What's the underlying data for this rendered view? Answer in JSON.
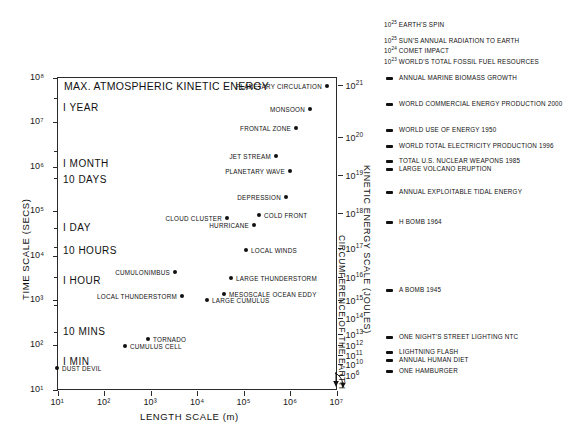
{
  "chart_data": {
    "type": "scatter",
    "title": "MAX. ATMOSPHERIC KINETIC ENERGY",
    "xlabel": "LENGTH SCALE (m)",
    "ylabel": "TIME SCALE (SECS)",
    "y2label": "KINETIC ENERGY SCALE (JOULES)",
    "y3label": "CIRCUMFERENCE OF THE EARTH",
    "xlim_exp": [
      1,
      7
    ],
    "ylim_exp": [
      1,
      8
    ],
    "y2lim_exp": [
      6,
      21
    ],
    "grid": false,
    "x_ticks": [
      "10¹",
      "10²",
      "10³",
      "10⁴",
      "10⁵",
      "10⁶",
      "10⁷"
    ],
    "x_tick_exps": [
      1,
      2,
      3,
      4,
      5,
      6,
      7
    ],
    "y_ticks": [
      "10¹",
      "10²",
      "10³",
      "10⁴",
      "10⁵",
      "10⁶",
      "10⁷",
      "10⁸"
    ],
    "y_tick_exps": [
      1,
      2,
      3,
      4,
      5,
      6,
      7,
      8
    ],
    "y2_ticks": [
      {
        "label": "10",
        "exp": "21",
        "y": 85
      },
      {
        "label": "10",
        "exp": "20",
        "y": 137
      },
      {
        "label": "10",
        "exp": "19",
        "y": 175
      },
      {
        "label": "10",
        "exp": "18",
        "y": 213
      },
      {
        "label": "10",
        "exp": "17",
        "y": 248
      },
      {
        "label": "10",
        "exp": "16",
        "y": 277
      },
      {
        "label": "10",
        "exp": "15",
        "y": 300
      },
      {
        "label": "10",
        "exp": "14",
        "y": 318
      },
      {
        "label": "10",
        "exp": "13",
        "y": 334
      },
      {
        "label": "10",
        "exp": "12",
        "y": 345
      },
      {
        "label": "10",
        "exp": "11",
        "y": 355
      },
      {
        "label": "10",
        "exp": "10",
        "y": 364
      },
      {
        "label": "10",
        "exp": "6",
        "y": 375
      }
    ],
    "time_labels": [
      {
        "text": "I YEAR",
        "x": 35,
        "y": 108
      },
      {
        "text": "I MONTH",
        "x": 35,
        "y": 164
      },
      {
        "text": "10 DAYS",
        "x": 35,
        "y": 180
      },
      {
        "text": "I DAY",
        "x": 35,
        "y": 228
      },
      {
        "text": "10 HOURS",
        "x": 35,
        "y": 251
      },
      {
        "text": "I HOUR",
        "x": 35,
        "y": 281
      },
      {
        "text": "10 MINS",
        "x": 35,
        "y": 332
      },
      {
        "text": "I MIN",
        "x": 35,
        "y": 362
      }
    ],
    "points": [
      {
        "name": "PLANETARY CIRCULATION",
        "x": 327,
        "y": 86,
        "side": "r"
      },
      {
        "name": "MONSOON",
        "x": 310,
        "y": 109,
        "side": "r"
      },
      {
        "name": "FRONTAL ZONE",
        "x": 296,
        "y": 128,
        "side": "r"
      },
      {
        "name": "JET STREAM",
        "x": 276,
        "y": 156,
        "side": "r"
      },
      {
        "name": "PLANETARY WAVE",
        "x": 290,
        "y": 171,
        "side": "r"
      },
      {
        "name": "DEPRESSION",
        "x": 286,
        "y": 197,
        "side": "r"
      },
      {
        "name": "COLD FRONT",
        "x": 259,
        "y": 215,
        "side": "l"
      },
      {
        "name": "CLOUD CLUSTER",
        "x": 227,
        "y": 218,
        "side": "r"
      },
      {
        "name": "HURRICANE",
        "x": 254,
        "y": 225,
        "side": "r"
      },
      {
        "name": "LOCAL WINDS",
        "x": 246,
        "y": 250,
        "side": "l"
      },
      {
        "name": "CUMULONIMBUS",
        "x": 175,
        "y": 272,
        "side": "r"
      },
      {
        "name": "LARGE THUNDERSTORM",
        "x": 231,
        "y": 278,
        "side": "l"
      },
      {
        "name": "LOCAL THUNDERSTORM",
        "x": 182,
        "y": 296,
        "side": "r"
      },
      {
        "name": "MESOSCALE OCEAN EDDY",
        "x": 224,
        "y": 294,
        "side": "l"
      },
      {
        "name": "LARGE CUMULUS",
        "x": 207,
        "y": 300,
        "side": "l"
      },
      {
        "name": "TORNADO",
        "x": 148,
        "y": 339,
        "side": "l"
      },
      {
        "name": "CUMULUS CELL",
        "x": 125,
        "y": 346,
        "side": "l"
      },
      {
        "name": "DUST DEVIL",
        "x": 57,
        "y": 368,
        "side": "l"
      }
    ],
    "energy_references": [
      {
        "label": "EARTH'S SPIN",
        "exp": "25",
        "prefix": "10",
        "y": 24,
        "marker": false
      },
      {
        "label": "SUN'S ANNUAL RADIATION TO EARTH",
        "exp": "25",
        "prefix": "10",
        "y": 40,
        "marker": false
      },
      {
        "label": "COMET IMPACT",
        "exp": "24",
        "prefix": "10",
        "y": 50,
        "marker": false
      },
      {
        "label": "WORLD'S TOTAL FOSSIL FUEL RESOURCES",
        "exp": "23",
        "prefix": "10",
        "y": 61,
        "marker": false
      },
      {
        "label": "ANNUAL MARINE BIOMASS GROWTH",
        "exp": "",
        "prefix": "",
        "y": 78,
        "marker": true
      },
      {
        "label": "WORLD COMMERCIAL ENERGY PRODUCTION 2000",
        "exp": "",
        "prefix": "",
        "y": 104,
        "marker": true
      },
      {
        "label": "WORLD USE OF ENERGY 1950",
        "exp": "",
        "prefix": "",
        "y": 130,
        "marker": true
      },
      {
        "label": "WORLD TOTAL ELECTRICITY PRODUCTION 1996",
        "exp": "",
        "prefix": "",
        "y": 146,
        "marker": true
      },
      {
        "label": "TOTAL U.S. NUCLEAR WEAPONS 1985",
        "exp": "",
        "prefix": "",
        "y": 161,
        "marker": true
      },
      {
        "label": "LARGE VOLCANO ERUPTION",
        "exp": "",
        "prefix": "",
        "y": 169,
        "marker": true
      },
      {
        "label": "ANNUAL EXPLOITABLE TIDAL ENERGY",
        "exp": "",
        "prefix": "",
        "y": 192,
        "marker": true
      },
      {
        "label": "H BOMB 1964",
        "exp": "",
        "prefix": "",
        "y": 222,
        "marker": true
      },
      {
        "label": "A BOMB 1945",
        "exp": "",
        "prefix": "",
        "y": 290,
        "marker": true
      },
      {
        "label": "ONE NIGHT'S STREET LIGHTING NTC",
        "exp": "",
        "prefix": "",
        "y": 337,
        "marker": true
      },
      {
        "label": "LIGHTNING FLASH",
        "exp": "",
        "prefix": "",
        "y": 352,
        "marker": true
      },
      {
        "label": "ANNUAL HUMAN DIET",
        "exp": "",
        "prefix": "",
        "y": 360,
        "marker": true
      },
      {
        "label": "ONE HAMBURGER",
        "exp": "",
        "prefix": "",
        "y": 371,
        "marker": true
      }
    ]
  }
}
